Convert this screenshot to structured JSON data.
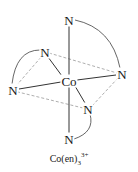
{
  "diagram": {
    "center_atom": {
      "label": "Co",
      "x": 69,
      "y": 81
    },
    "ligand_atoms": [
      {
        "id": "n_top",
        "label": "N",
        "x": 69,
        "y": 20
      },
      {
        "id": "n_upper_left",
        "label": "N",
        "x": 45,
        "y": 52
      },
      {
        "id": "n_right",
        "label": "N",
        "x": 122,
        "y": 74
      },
      {
        "id": "n_left",
        "label": "N",
        "x": 13,
        "y": 90
      },
      {
        "id": "n_lower_right",
        "label": "N",
        "x": 88,
        "y": 109
      },
      {
        "id": "n_bottom",
        "label": "N",
        "x": 69,
        "y": 139
      }
    ],
    "caption": {
      "base": "Co(en)",
      "subscript": "3",
      "superscript": "3+"
    },
    "colors": {
      "bond": "#333333",
      "dashed_edge": "#999999",
      "chelate_arc": "#555555",
      "text": "#1a1a1a"
    }
  }
}
